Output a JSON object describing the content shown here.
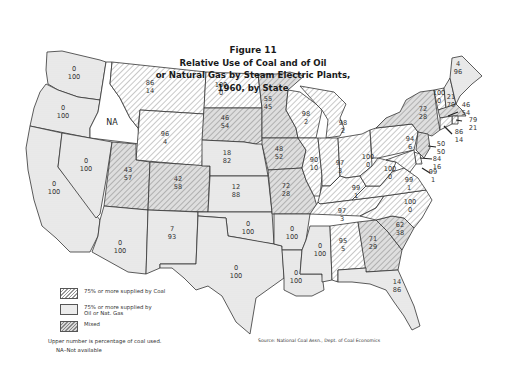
{
  "title": {
    "line0": "Figure 11",
    "line1": "Relative Use of Coal and of Oil",
    "line2": "or Natural Gas by Steam Electric Plants,",
    "line3": "1960, by State"
  },
  "legend": {
    "coal": "75% or more supplied by Coal",
    "oil_line1": "75% or more supplied by",
    "oil_line2": "Oil or Nat. Gas",
    "mixed": "Mixed"
  },
  "note": {
    "upper": "Upper number is percentage of coal used.",
    "na": "NA–Not available"
  },
  "source": "Source: National Coal Assn., Dept. of Coal Economics",
  "colors": {
    "coal_hatch": "#999999",
    "oil_fill": "#ececec",
    "mixed_fill": "#d8d8d8",
    "border": "#333333"
  },
  "states": {
    "WA": {
      "coal": "0",
      "oil": "100",
      "category": "oil"
    },
    "OR": {
      "coal": "0",
      "oil": "100",
      "category": "oil"
    },
    "CA": {
      "coal": "0",
      "oil": "100",
      "category": "oil"
    },
    "ID": {
      "label": "NA",
      "category": "na"
    },
    "NV": {
      "coal": "0",
      "oil": "100",
      "category": "oil"
    },
    "MT": {
      "coal": "86",
      "oil": "14",
      "category": "coal"
    },
    "WY": {
      "coal": "96",
      "oil": "4",
      "category": "coal"
    },
    "UT": {
      "coal": "43",
      "oil": "57",
      "category": "mixed"
    },
    "CO": {
      "coal": "42",
      "oil": "58",
      "category": "mixed"
    },
    "AZ": {
      "coal": "0",
      "oil": "100",
      "category": "oil"
    },
    "NM": {
      "coal": "7",
      "oil": "93",
      "category": "oil"
    },
    "ND": {
      "coal": "100",
      "oil": "0",
      "category": "coal"
    },
    "SD": {
      "coal": "46",
      "oil": "54",
      "category": "mixed"
    },
    "NE": {
      "coal": "18",
      "oil": "82",
      "category": "oil"
    },
    "KS": {
      "coal": "12",
      "oil": "88",
      "category": "oil"
    },
    "OK": {
      "coal": "0",
      "oil": "100",
      "category": "oil"
    },
    "TX": {
      "coal": "0",
      "oil": "100",
      "category": "oil"
    },
    "MN": {
      "coal": "55",
      "oil": "45",
      "category": "mixed"
    },
    "IA": {
      "coal": "48",
      "oil": "52",
      "category": "mixed"
    },
    "MO": {
      "coal": "72",
      "oil": "28",
      "category": "mixed"
    },
    "AR": {
      "coal": "0",
      "oil": "100",
      "category": "oil"
    },
    "LA": {
      "coal": "0",
      "oil": "100",
      "category": "oil"
    },
    "WI": {
      "coal": "98",
      "oil": "2",
      "category": "coal"
    },
    "IL": {
      "coal": "90",
      "oil": "10",
      "category": "coal"
    },
    "MI": {
      "coal": "98",
      "oil": "2",
      "category": "coal"
    },
    "IN": {
      "coal": "97",
      "oil": "3",
      "category": "coal"
    },
    "OH": {
      "coal": "100",
      "oil": "0",
      "category": "coal"
    },
    "KY": {
      "coal": "99",
      "oil": "1",
      "category": "coal"
    },
    "TN": {
      "coal": "97",
      "oil": "3",
      "category": "coal"
    },
    "MS": {
      "coal": "0",
      "oil": "100",
      "category": "oil"
    },
    "AL": {
      "coal": "95",
      "oil": "5",
      "category": "coal"
    },
    "GA": {
      "coal": "71",
      "oil": "29",
      "category": "mixed"
    },
    "FL": {
      "coal": "14",
      "oil": "86",
      "category": "oil"
    },
    "SC": {
      "coal": "62",
      "oil": "38",
      "category": "mixed"
    },
    "NC": {
      "coal": "100",
      "oil": "0",
      "category": "coal"
    },
    "VA": {
      "coal": "99",
      "oil": "1",
      "category": "coal"
    },
    "WV": {
      "coal": "100",
      "oil": "0",
      "category": "coal"
    },
    "PA": {
      "coal": "94",
      "oil": "6",
      "category": "coal"
    },
    "NY": {
      "coal": "72",
      "oil": "28",
      "category": "mixed"
    },
    "VT": {
      "coal": "100",
      "oil": "0",
      "category": "coal"
    },
    "NH": {
      "coal": "21",
      "oil": "79",
      "category": "oil"
    },
    "ME": {
      "coal": "4",
      "oil": "96",
      "category": "oil"
    },
    "MA": {
      "coal": "46",
      "oil": "54",
      "category": "mixed"
    },
    "RI": {
      "coal": "79",
      "oil": "21",
      "category": "coal"
    },
    "CT": {
      "coal": "86",
      "oil": "14",
      "category": "coal"
    },
    "NJ": {
      "coal": "50",
      "oil": "50",
      "category": "mixed"
    },
    "DE": {
      "coal": "84",
      "oil": "16",
      "category": "coal"
    },
    "MD": {
      "coal": "99",
      "oil": "1",
      "category": "coal"
    }
  }
}
